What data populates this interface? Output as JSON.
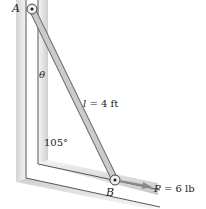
{
  "diagram": {
    "labels": {
      "point_a": "A",
      "point_b": "B",
      "angle_theta": "θ",
      "length": "l = 4 ft",
      "corner_angle": "105°",
      "force": "P = 6 lb"
    },
    "colors": {
      "guide_shade": "#c8c8c8",
      "guide_dark": "#9a9a9a",
      "rod_fill": "#c9c9c9",
      "rod_edge": "#6e6e6e",
      "arrow": "#8a8a8a"
    }
  }
}
